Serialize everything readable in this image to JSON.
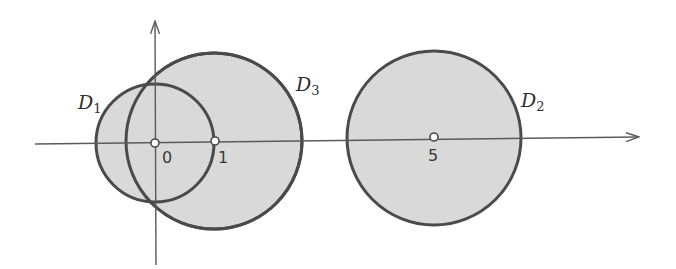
{
  "figure": {
    "colors": {
      "fill": "#d9d9d9",
      "stroke": "#4a4a4a",
      "axis": "#5a5a5a",
      "background": "#ffffff"
    },
    "axes": {
      "horizontal": {
        "x1": 35,
        "y1": 144,
        "x2": 638,
        "y2": 137,
        "arrow": "right"
      },
      "vertical": {
        "x1": 156,
        "y1": 265,
        "x2": 155,
        "y2": 22,
        "arrow": "up"
      }
    },
    "disks": [
      {
        "name": "D",
        "subscript": "1",
        "center_value": 0,
        "cx": 155,
        "cy": 143,
        "r": 59,
        "label_x": 78,
        "label_y": 93
      },
      {
        "name": "D",
        "subscript": "3",
        "center_value": 1,
        "cx": 214,
        "cy": 141,
        "r": 88,
        "label_x": 296,
        "label_y": 75
      },
      {
        "name": "D",
        "subscript": "2",
        "center_value": 5,
        "cx": 434,
        "cy": 138,
        "r": 87,
        "label_x": 521,
        "label_y": 91
      }
    ],
    "points": [
      {
        "label": "0",
        "cx": 155,
        "cy": 143,
        "label_x": 162,
        "label_y": 150
      },
      {
        "label": "1",
        "cx": 215,
        "cy": 141,
        "label_x": 218,
        "label_y": 150
      },
      {
        "label": "5",
        "cx": 434,
        "cy": 137,
        "label_x": 428,
        "label_y": 148
      }
    ]
  },
  "labels": {
    "d1": {
      "letter": "D",
      "sub": "1"
    },
    "d2": {
      "letter": "D",
      "sub": "2"
    },
    "d3": {
      "letter": "D",
      "sub": "3"
    },
    "tick0": "0",
    "tick1": "1",
    "tick5": "5"
  }
}
